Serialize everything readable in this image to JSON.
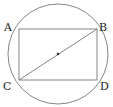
{
  "diagram": {
    "type": "geometry",
    "labels": {
      "A": "A",
      "B": "B",
      "C": "C",
      "D": "D"
    },
    "colors": {
      "stroke": "#555555",
      "text": "#222222",
      "center": "#333333"
    }
  }
}
